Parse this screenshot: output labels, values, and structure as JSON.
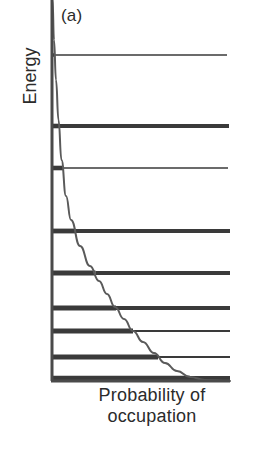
{
  "figure": {
    "panel_label": "(a)",
    "y_axis_label": "Energy",
    "x_axis_label_line1": "Probability  of",
    "x_axis_label_line2": "occupation",
    "ink_color": "#3a3a3a",
    "axis_color": "#4a4a4a",
    "curve_color": "#5a5a5a",
    "background_color": "#ffffff"
  },
  "chart_data": {
    "type": "line",
    "title": "(a)",
    "xlabel": "Probability of occupation",
    "ylabel": "Energy",
    "grid": false,
    "legend": null,
    "xlim": [
      0,
      1
    ],
    "ylim": [
      0,
      1
    ],
    "axes_pixels": {
      "y_axis_x": 52,
      "x_axis_y": 381,
      "plot_left": 52,
      "plot_right": 230,
      "plot_top": 0,
      "plot_bottom": 381
    },
    "series": [
      {
        "name": "occupation probability",
        "type": "curve",
        "points_pixels": [
          [
            52.5,
            0
          ],
          [
            54,
            40
          ],
          [
            56,
            80
          ],
          [
            58.5,
            120
          ],
          [
            61.5,
            160
          ],
          [
            66,
            196
          ],
          [
            71,
            220
          ],
          [
            80,
            246
          ],
          [
            90,
            266
          ],
          [
            99,
            281
          ],
          [
            107,
            294
          ],
          [
            115,
            307
          ],
          [
            124,
            319
          ],
          [
            133,
            331
          ],
          [
            143,
            342
          ],
          [
            154,
            353
          ],
          [
            165,
            363
          ],
          [
            177,
            371
          ],
          [
            190,
            377
          ],
          [
            205,
            380
          ],
          [
            230,
            381
          ]
        ]
      }
    ],
    "energy_levels": [
      {
        "index": 1,
        "y": 55,
        "thickness": 1.6,
        "stub_thickness": 3.6,
        "x_start": 52,
        "x_end": 227,
        "curve_x": 53.6
      },
      {
        "index": 2,
        "y": 126,
        "thickness": 4.0,
        "stub_thickness": 4.6,
        "x_start": 52,
        "x_end": 229,
        "curve_x": 58.9
      },
      {
        "index": 3,
        "y": 168,
        "thickness": 1.6,
        "stub_thickness": 4.6,
        "x_start": 52,
        "x_end": 228,
        "curve_x": 63.5
      },
      {
        "index": 4,
        "y": 231,
        "thickness": 4.2,
        "stub_thickness": 4.8,
        "x_start": 52,
        "x_end": 230,
        "curve_x": 75.5
      },
      {
        "index": 5,
        "y": 273,
        "thickness": 4.0,
        "stub_thickness": 5.0,
        "x_start": 52,
        "x_end": 230,
        "curve_x": 95.5
      },
      {
        "index": 6,
        "y": 308,
        "thickness": 4.0,
        "stub_thickness": 5.0,
        "x_start": 52,
        "x_end": 230,
        "curve_x": 116.0
      },
      {
        "index": 7,
        "y": 331,
        "thickness": 1.8,
        "stub_thickness": 5.0,
        "x_start": 52,
        "x_end": 230,
        "curve_x": 133.0
      },
      {
        "index": 8,
        "y": 357,
        "thickness": 1.8,
        "stub_thickness": 5.0,
        "x_start": 52,
        "x_end": 230,
        "curve_x": 158.0
      },
      {
        "index": 9,
        "y": 378,
        "thickness": 4.2,
        "stub_thickness": 4.6,
        "x_start": 52,
        "x_end": 230,
        "curve_x": 190.0
      }
    ]
  }
}
